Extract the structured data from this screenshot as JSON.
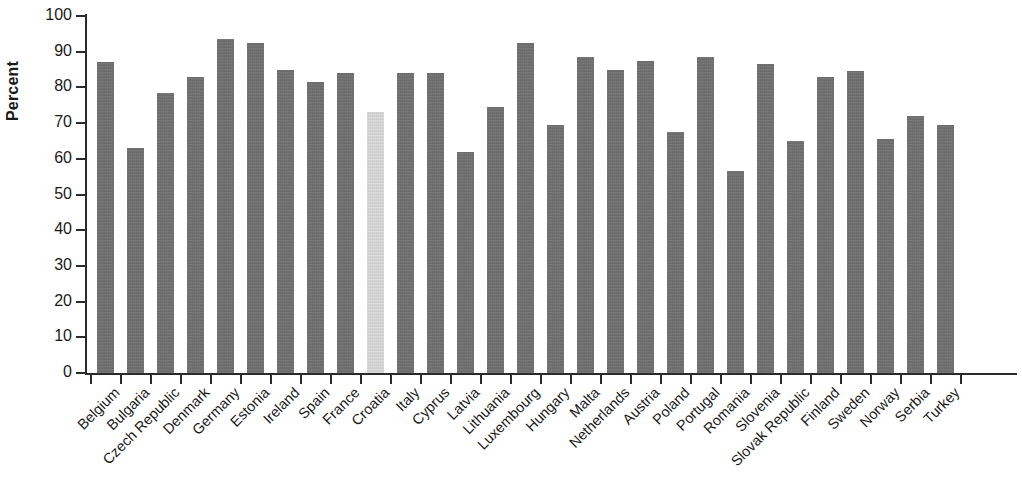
{
  "chart_data": {
    "type": "bar",
    "title": "",
    "xlabel": "",
    "ylabel": "Percent",
    "ylim": [
      0,
      100
    ],
    "ytick_step": 10,
    "yticks": [
      0,
      10,
      20,
      30,
      40,
      50,
      60,
      70,
      80,
      90,
      100
    ],
    "grid": false,
    "legend": "none",
    "bar_color": "#6e6e6e",
    "highlight_color": "#d3d3d3",
    "highlight_category": "Croatia",
    "categories": [
      "Belgium",
      "Bulgaria",
      "Czech Republic",
      "Denmark",
      "Germany",
      "Estonia",
      "Ireland",
      "Spain",
      "France",
      "Croatia",
      "Italy",
      "Cyprus",
      "Latvia",
      "Lithuania",
      "Luxembourg",
      "Hungary",
      "Malta",
      "Netherlands",
      "Austria",
      "Poland",
      "Portugal",
      "Romania",
      "Slovenia",
      "Slovak Republic",
      "Finland",
      "Sweden",
      "Norway",
      "Serbia",
      "Turkey"
    ],
    "values": [
      87.0,
      63.0,
      78.5,
      83.0,
      93.5,
      92.5,
      85.0,
      81.5,
      84.0,
      73.0,
      84.0,
      84.0,
      62.0,
      74.5,
      92.5,
      69.5,
      88.5,
      85.0,
      87.5,
      67.5,
      88.5,
      56.5,
      86.5,
      65.0,
      83.0,
      84.5,
      65.5,
      72.0,
      69.5
    ]
  }
}
